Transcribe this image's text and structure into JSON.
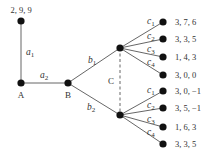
{
  "diagram": {
    "type": "game-tree",
    "colors": {
      "line": "#555555",
      "node": "#111111",
      "text": "#333333"
    },
    "root_payoff": {
      "label": "2, 9, 9"
    },
    "nodes": {
      "A": {
        "label": "A"
      },
      "B": {
        "label": "B"
      },
      "C": {
        "label": "C"
      }
    },
    "edges": {
      "a1": {
        "base": "a",
        "sub": "1"
      },
      "a2": {
        "base": "a",
        "sub": "2"
      },
      "b1": {
        "base": "b",
        "sub": "1"
      },
      "b2": {
        "base": "b",
        "sub": "2"
      }
    },
    "upper_branch": {
      "edges": [
        {
          "base": "c",
          "sub": "1"
        },
        {
          "base": "c",
          "sub": "2"
        },
        {
          "base": "c",
          "sub": "3"
        },
        {
          "base": "c",
          "sub": "4"
        }
      ],
      "payoffs": [
        "3, 7, 6",
        "3, 3, 5",
        "1, 4, 3",
        "3, 0, 0"
      ]
    },
    "lower_branch": {
      "edges": [
        {
          "base": "c",
          "sub": "1"
        },
        {
          "base": "c",
          "sub": "2"
        },
        {
          "base": "c",
          "sub": "3"
        },
        {
          "base": "c",
          "sub": "4"
        }
      ],
      "payoffs": [
        "3, 0, −1",
        "3, 5, −1",
        "1, 6, 3",
        "3, 3, 5"
      ]
    },
    "information_set": {
      "label": "C",
      "style": "dashed"
    }
  }
}
